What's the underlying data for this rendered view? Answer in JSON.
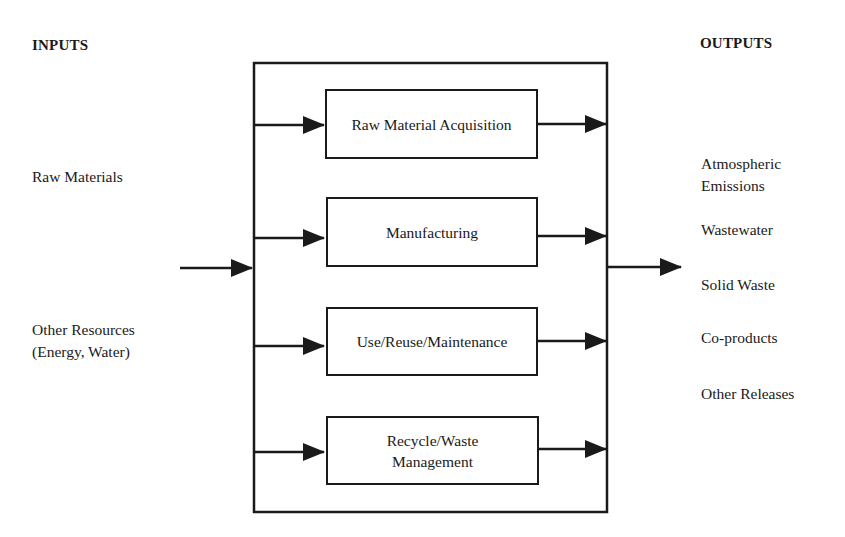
{
  "diagram": {
    "inputs": {
      "heading": "INPUTS",
      "items": [
        "Raw Materials",
        "Other Resources\n(Energy, Water)"
      ]
    },
    "outputs": {
      "heading": "OUTPUTS",
      "items": [
        "Atmospheric\nEmissions",
        "Wastewater",
        "Solid Waste",
        "Co-products",
        "Other Releases"
      ]
    },
    "stages": [
      {
        "label": "Raw Material Acquisition"
      },
      {
        "label": "Manufacturing"
      },
      {
        "label": "Use/Reuse/Maintenance"
      },
      {
        "label": "Recycle/Waste\nManagement"
      }
    ],
    "colors": {
      "line": "#1a1a1a",
      "background": "#ffffff"
    }
  }
}
